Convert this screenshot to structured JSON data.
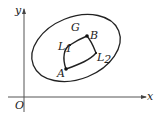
{
  "diagram": {
    "axes": {
      "x_label": "x",
      "y_label": "y",
      "origin_label": "O"
    },
    "region_label": "G",
    "points": [
      {
        "name": "A",
        "x": 66,
        "y": 69
      },
      {
        "name": "B",
        "x": 87,
        "y": 36
      }
    ],
    "paths": [
      {
        "name": "L",
        "subscript": "1"
      },
      {
        "name": "L",
        "subscript": "2"
      }
    ],
    "colors": {
      "stroke": "#222222",
      "axis": "#555555",
      "background": "#ffffff"
    }
  }
}
